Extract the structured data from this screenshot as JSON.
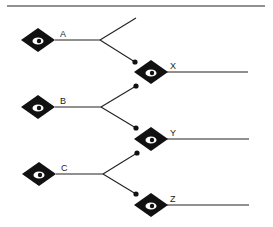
{
  "diagram": {
    "top_rule": {
      "x1": 7,
      "y1": 6,
      "x2": 265,
      "y2": 6
    },
    "sources": [
      {
        "label": "A",
        "cx": 38,
        "cy": 40,
        "line_end_x": 100,
        "up_end": {
          "x": 136,
          "y": 18,
          "dot": false
        },
        "down_end": {
          "x": 135,
          "y": 62,
          "dot": true
        }
      },
      {
        "label": "B",
        "cx": 38,
        "cy": 107,
        "line_end_x": 101,
        "up_end": {
          "x": 136,
          "y": 86,
          "dot": true
        },
        "down_end": {
          "x": 136,
          "y": 128,
          "dot": true
        }
      },
      {
        "label": "C",
        "cx": 39,
        "cy": 174,
        "line_end_x": 103,
        "up_end": {
          "x": 137,
          "y": 153,
          "dot": true
        },
        "down_end": {
          "x": 136,
          "y": 194,
          "dot": true
        }
      }
    ],
    "targets": [
      {
        "label": "X",
        "cx": 151,
        "cy": 72,
        "line_end_x": 248
      },
      {
        "label": "Y",
        "cx": 151,
        "cy": 139,
        "line_end_x": 249
      },
      {
        "label": "Z",
        "cx": 151,
        "cy": 205,
        "line_end_x": 249
      }
    ],
    "node_icon": "eye-in-diamond-icon",
    "colors": {
      "ink": "#111111",
      "background": "#ffffff"
    }
  }
}
